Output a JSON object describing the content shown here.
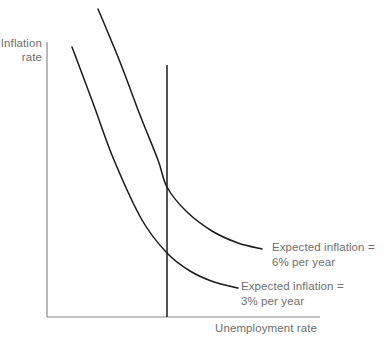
{
  "figure": {
    "background_color": "#ffffff"
  },
  "axes": {
    "y_label": "Inflation\nrate",
    "y_label_line1": "Inflation",
    "y_label_line2": "rate",
    "x_label": "Unemployment rate",
    "axis_color": "#8a8a8a",
    "text_color": "#6e6e6e"
  },
  "annotations": {
    "high_curve": {
      "line1": "Expected inflation =",
      "line2": "6% per year"
    },
    "low_curve": {
      "line1": "Expected inflation =",
      "line2": "3% per year"
    }
  },
  "chart_data": {
    "type": "line",
    "title": "",
    "xlabel": "Unemployment rate",
    "ylabel": "Inflation rate",
    "grid": false,
    "legend_position": "inline-right",
    "axis_ranges": {
      "x_axis_pixels": [
        47,
        320
      ],
      "y_axis_pixels": [
        42,
        317
      ]
    },
    "curve_color": "#1a1a1a",
    "axis_color": "#8a8a8a",
    "series": [
      {
        "name": "Short-run Phillips curve, expected inflation = 6% per year",
        "label_line1": "Expected inflation =",
        "label_line2": "6% per year",
        "expected_inflation_percent": 6,
        "path_points": [
          [
            98,
            9
          ],
          [
            120,
            62
          ],
          [
            140,
            115
          ],
          [
            158,
            160
          ],
          [
            167,
            187
          ],
          [
            186,
            211
          ],
          [
            212,
            231
          ],
          [
            238,
            243
          ],
          [
            262,
            249
          ]
        ],
        "crosses_natural_rate_at": [
          167,
          187
        ]
      },
      {
        "name": "Short-run Phillips curve, expected inflation = 3% per year",
        "label_line1": "Expected inflation =",
        "label_line2": "3% per year",
        "expected_inflation_percent": 3,
        "path_points": [
          [
            72,
            47
          ],
          [
            93,
            103
          ],
          [
            114,
            160
          ],
          [
            142,
            220
          ],
          [
            167,
            253
          ],
          [
            190,
            271
          ],
          [
            214,
            282
          ],
          [
            238,
            288
          ]
        ],
        "crosses_natural_rate_at": [
          167,
          253
        ]
      }
    ],
    "vertical_line": {
      "name": "Natural rate of unemployment (long-run Phillips curve)",
      "x_pixel": 167,
      "top_pixel": 65,
      "bottom_pixel": 317,
      "color": "#1a1a1a"
    }
  }
}
